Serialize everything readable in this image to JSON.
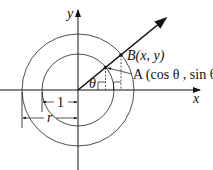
{
  "diagram": {
    "axes": {
      "x_label": "x",
      "y_label": "y"
    },
    "circles": [
      {
        "name": "unit-circle",
        "radius_label": "1"
      },
      {
        "name": "circle-r",
        "radius_label": "r"
      }
    ],
    "points": {
      "B": {
        "label": "B(x, y)"
      },
      "A": {
        "label": "A (cos θ , sin θ)"
      }
    },
    "angle_label": "θ",
    "colors": {
      "stroke": "#111111",
      "background": "#ffffff"
    }
  }
}
